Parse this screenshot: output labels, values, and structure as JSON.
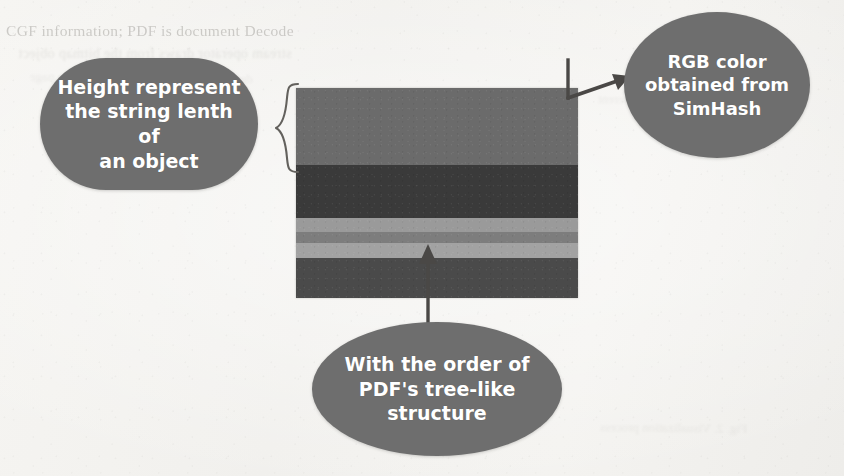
{
  "figure": {
    "background_color": "#f4f3f1",
    "bubble_color": "#6e6e6e",
    "bubble_text_color": "#ffffff"
  },
  "callouts": {
    "height": {
      "name": "height-callout",
      "line1": "Height represent",
      "line2": "the string lenth of",
      "line3": "an object",
      "text": "Height represent the string lenth of an object"
    },
    "rgb": {
      "name": "rgb-callout",
      "line1": "RGB color",
      "line2": "obtained from",
      "line3": "SimHash",
      "text": "RGB color obtained from SimHash"
    },
    "order": {
      "name": "order-callout",
      "line1": "With the order of",
      "line2": "PDF's tree-like",
      "line3": "structure",
      "text": "With the order of PDF's tree-like structure"
    }
  },
  "connectors": {
    "brace": "curly-brace",
    "arrow_to_rgb": "arrow-up-right",
    "arrow_from_order": "arrow-up"
  },
  "chart_data": {
    "type": "bar",
    "orientation": "stacked-vertical",
    "xlabel": "",
    "ylabel": "String length of object",
    "grid": false,
    "legend": false,
    "axis_visible": false,
    "total_height_px": 210,
    "width_px": 282,
    "categories": [
      "object-1",
      "object-2",
      "object-3",
      "object-4",
      "object-5",
      "object-6"
    ],
    "values": [
      77,
      53,
      14,
      11,
      15,
      40
    ],
    "colors": [
      "#6b6b6b",
      "#3a3a3a",
      "#9a9a9a",
      "#7d7d7d",
      "#a2a2a2",
      "#4a4a4a"
    ],
    "series": [
      {
        "name": "string length (px)",
        "values": [
          77,
          53,
          14,
          11,
          15,
          40
        ]
      }
    ],
    "annotations": [
      "Height represent the string lenth of an object",
      "RGB color obtained from SimHash",
      "With the order of PDF's tree-like structure"
    ]
  },
  "background_text": {
    "line1": "CGF information; PDF is document Decode",
    "line2": "stream operator draws from the bitmap object",
    "line3": "described in the content stream of the page",
    "line4": "these operators can be different",
    "line5": "Fig. 2. Visualization process"
  }
}
